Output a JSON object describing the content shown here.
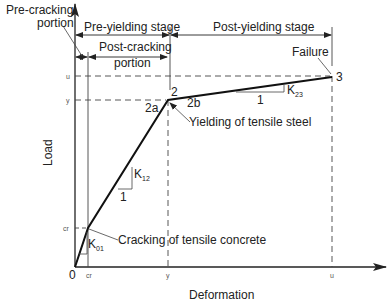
{
  "diagram": {
    "type": "load-deformation curve",
    "axes": {
      "x_label": "Deformation",
      "y_label": "Load",
      "origin_label": "0",
      "x_ticks": [
        "cr",
        "y",
        "u"
      ],
      "y_ticks": [
        "cr",
        "y",
        "u"
      ]
    },
    "stages": {
      "pre_cracking": "Pre-cracking\nportion",
      "pre_cracking_line1": "Pre-cracking",
      "pre_cracking_line2": "portion",
      "pre_yielding": "Pre-yielding stage",
      "post_cracking_line1": "Post-cracking",
      "post_cracking_line2": "portion",
      "post_yielding": "Post-yielding stage"
    },
    "points": {
      "p2": "2",
      "p2a": "2a",
      "p2b": "2b",
      "p3": "3"
    },
    "annotations": {
      "failure": "Failure",
      "yielding": "Yielding of tensile steel",
      "cracking": "Cracking of tensile concrete"
    },
    "slopes": {
      "k01": "K",
      "k01_sub": "01",
      "k12": "K",
      "k12_sub": "12",
      "k12_run": "1",
      "k23": "K",
      "k23_sub": "23",
      "k23_run": "1"
    }
  }
}
